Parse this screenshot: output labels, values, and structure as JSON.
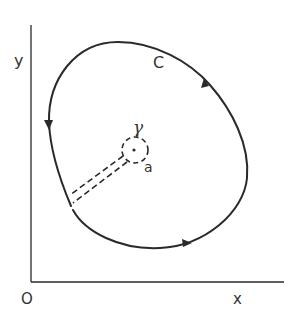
{
  "figure": {
    "colors": {
      "stroke": "#2a2a2a",
      "text": "#333333",
      "background": "#ffffff"
    },
    "axes": {
      "x_label": "x",
      "y_label": "y",
      "origin_label": "O"
    },
    "contour": {
      "label": "C",
      "orientation": "counterclockwise",
      "arrows": 3
    },
    "inner_circle": {
      "label": "γ",
      "style": "dashed",
      "center_label": "a"
    },
    "cut": {
      "style": "dashed double line"
    }
  }
}
